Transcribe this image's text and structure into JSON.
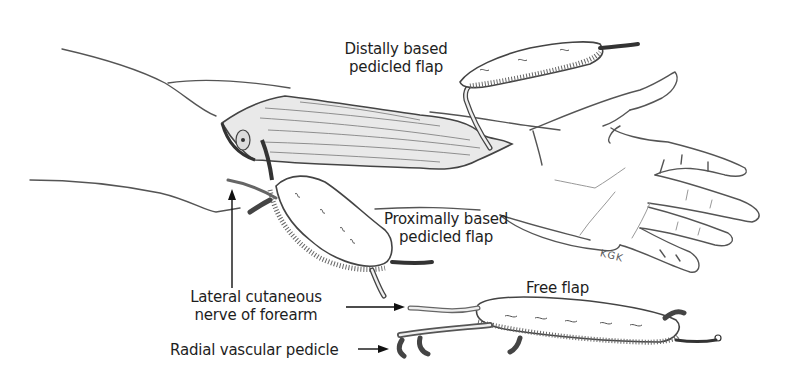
{
  "figure": {
    "labels": {
      "distal_flap": [
        "Distally based",
        "pedicled flap"
      ],
      "proximal_flap": [
        "Proximally based",
        "pedicled flap"
      ],
      "free_flap": "Free flap",
      "nerve": [
        "Lateral cutaneous",
        "nerve of forearm"
      ],
      "pedicle": "Radial vascular pedicle"
    },
    "signature": "KGK",
    "colors": {
      "background": "#ffffff",
      "line": "#444444",
      "text": "#1e1e1e",
      "muscle_shade": "#e9e9e9"
    }
  }
}
